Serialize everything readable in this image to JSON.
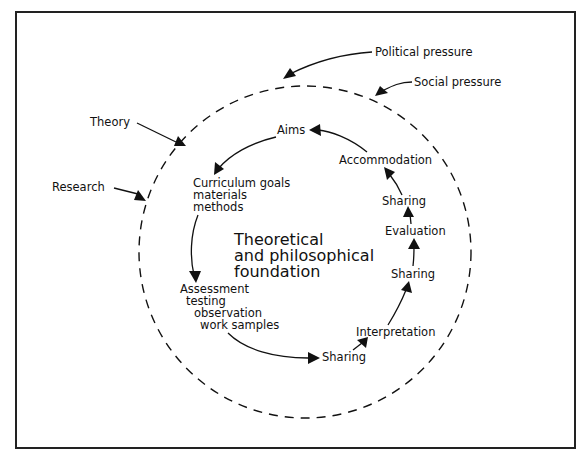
{
  "diagram": {
    "external_influences": {
      "political": "Political pressure",
      "social": "Social pressure",
      "theory": "Theory",
      "research": "Research"
    },
    "center": {
      "line1": "Theoretical",
      "line2": "and philosophical",
      "line3": "foundation"
    },
    "cycle": {
      "aims": "Aims",
      "curriculum": {
        "line1": "Curriculum goals",
        "line2": "materials",
        "line3": "methods"
      },
      "assessment": {
        "line1": "Assessment",
        "line2": "testing",
        "line3": "observation",
        "line4": "work samples"
      },
      "sharing_1": "Sharing",
      "interpretation": "Interpretation",
      "sharing_2": "Sharing",
      "evaluation": "Evaluation",
      "sharing_3": "Sharing",
      "accommodation": "Accommodation"
    },
    "colors": {
      "ink": "#111111",
      "background": "#ffffff"
    }
  }
}
